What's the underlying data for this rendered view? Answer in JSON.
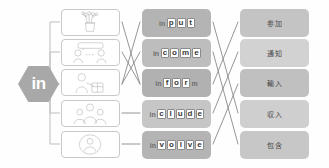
{
  "prefix": {
    "label": "in",
    "shape": "hexagon",
    "color": "#a8a8a8"
  },
  "pictures": [
    {
      "name": "picture-card-flowers-vase",
      "alt": "hand-drawn vase with flowers"
    },
    {
      "name": "picture-card-two-people-talking",
      "alt": "hand-drawn two people talking with speech banner"
    },
    {
      "name": "picture-card-person-with-box",
      "alt": "hand-drawn person carrying a box"
    },
    {
      "name": "picture-card-group-of-people",
      "alt": "hand-drawn group of people together"
    },
    {
      "name": "picture-card-person-in-circle",
      "alt": "hand-drawn person enclosed in a circle"
    }
  ],
  "words": [
    {
      "word": "input",
      "segments": [
        {
          "text": "in",
          "boxed": false
        },
        {
          "text": "p",
          "boxed": true
        },
        {
          "text": "u",
          "boxed": true
        },
        {
          "text": "t",
          "boxed": true
        }
      ]
    },
    {
      "word": "income",
      "segments": [
        {
          "text": "in",
          "boxed": false
        },
        {
          "text": "c",
          "boxed": true
        },
        {
          "text": "o",
          "boxed": true
        },
        {
          "text": "m",
          "boxed": true
        },
        {
          "text": "e",
          "boxed": true
        }
      ]
    },
    {
      "word": "inform",
      "segments": [
        {
          "text": "in",
          "boxed": false
        },
        {
          "text": "f",
          "boxed": true
        },
        {
          "text": "o",
          "boxed": true
        },
        {
          "text": "r",
          "boxed": true
        },
        {
          "text": "m",
          "boxed": false
        }
      ]
    },
    {
      "word": "include",
      "segments": [
        {
          "text": "in",
          "boxed": false
        },
        {
          "text": "c",
          "boxed": true
        },
        {
          "text": "l",
          "boxed": true
        },
        {
          "text": "u",
          "boxed": true
        },
        {
          "text": "d",
          "boxed": true
        },
        {
          "text": "e",
          "boxed": true
        }
      ]
    },
    {
      "word": "involve",
      "segments": [
        {
          "text": "in",
          "boxed": false
        },
        {
          "text": "v",
          "boxed": true
        },
        {
          "text": "o",
          "boxed": true
        },
        {
          "text": "l",
          "boxed": true
        },
        {
          "text": "v",
          "boxed": true
        },
        {
          "text": "e",
          "boxed": true
        }
      ]
    }
  ],
  "meanings": [
    {
      "text": "参加"
    },
    {
      "text": "通知"
    },
    {
      "text": "輸入"
    },
    {
      "text": "収入"
    },
    {
      "text": "包含"
    }
  ],
  "connectors": {
    "bracket_color": "#bdbdbd",
    "line_color": "#8a8a8a"
  }
}
